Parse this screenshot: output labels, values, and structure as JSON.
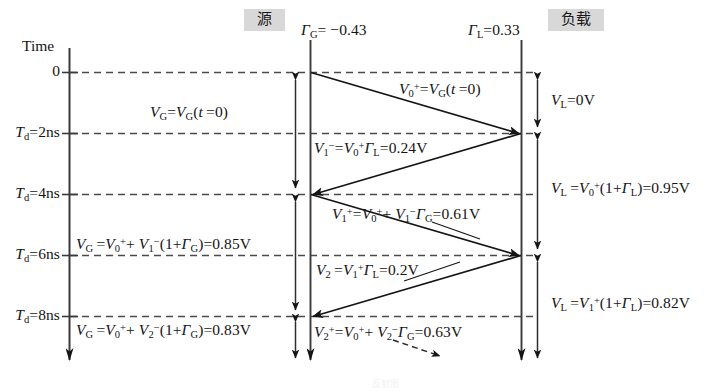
{
  "diagram": {
    "title_time_axis": "Time",
    "source_header": "源",
    "load_header": "负载",
    "gamma_g": "ΓG= −0.43",
    "gamma_l": "ΓL=0.33",
    "bottom_caption": "反射图"
  },
  "axis": {
    "ticks": [
      {
        "label": "0",
        "time_ns": 0
      },
      {
        "label": "Td=2ns",
        "time_ns": 2
      },
      {
        "label": "Td=4ns",
        "time_ns": 4
      },
      {
        "label": "Td=6ns",
        "time_ns": 6
      },
      {
        "label": "Td=8ns",
        "time_ns": 8
      }
    ]
  },
  "waves": [
    {
      "name": "V0-plus-incident",
      "label": "V0+=VG(t =0)",
      "direction": "source-to-load",
      "from_ns": 0,
      "to_ns": 2
    },
    {
      "name": "V1-minus-reflected",
      "label": "V1−=V0+ΓL=0.24V",
      "value": "0.24V",
      "direction": "load-to-source",
      "from_ns": 2,
      "to_ns": 4
    },
    {
      "name": "V1-plus-incident",
      "label": "V1+=V0+ + V1−ΓG=0.61V",
      "value": "0.61V",
      "direction": "source-to-load",
      "from_ns": 4,
      "to_ns": 6
    },
    {
      "name": "V2-minus-reflected",
      "label": "V2 =V1+ΓL=0.2V",
      "value": "0.2V",
      "direction": "load-to-source",
      "from_ns": 6,
      "to_ns": 8
    },
    {
      "name": "V2-plus-incident",
      "label": "V2+=V0+ + V2−ΓG=0.63V",
      "value": "0.63V",
      "direction": "source-to-load",
      "from_ns": 8,
      "to_ns": 10
    }
  ],
  "source_voltages": [
    {
      "name": "vg-initial",
      "label": "VG=VG(t =0)",
      "from_ns": 0,
      "to_ns": 4
    },
    {
      "name": "vg-second",
      "label": "VG =V0+ + V1−(1+ΓG)=0.85V",
      "value": "0.85V",
      "from_ns": 4,
      "to_ns": 8
    },
    {
      "name": "vg-third",
      "label": "VG =V0+ + V2−(1+ΓG)=0.83V",
      "value": "0.83V",
      "from_ns": 8,
      "to_ns": 10
    }
  ],
  "load_voltages": [
    {
      "name": "vl-zero",
      "label": "VL=0V",
      "value": "0V",
      "from_ns": 0,
      "to_ns": 2
    },
    {
      "name": "vl-first",
      "label": "VL =V0+(1+ΓL)=0.95V",
      "value": "0.95V",
      "from_ns": 2,
      "to_ns": 6
    },
    {
      "name": "vl-second",
      "label": "VL =V1+(1+ΓL)=0.82V",
      "value": "0.82V",
      "from_ns": 6,
      "to_ns": 10
    }
  ],
  "colors": {
    "ink": "#1a1a1a",
    "dash": "#555555",
    "header_bg": "#d8d8d8"
  }
}
